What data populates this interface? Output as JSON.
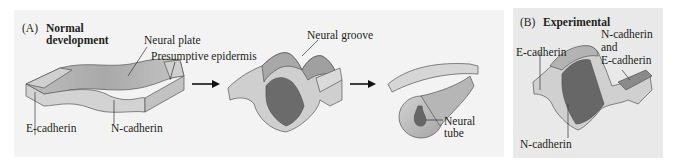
{
  "figure": {
    "panel_a": {
      "letter": "(A)",
      "title_line1": "Normal",
      "title_line2": "development",
      "labels": {
        "neural_plate": "Neural plate",
        "presumptive_epidermis": "Presumptive epidermis",
        "e_cadherin": "E-cadherin",
        "n_cadherin": "N-cadherin",
        "neural_groove": "Neural groove",
        "neural_tube_line1": "Neural",
        "neural_tube_line2": "tube"
      },
      "stages": [
        "Neural plate",
        "Neural groove",
        "Neural tube"
      ]
    },
    "panel_b": {
      "letter": "(B)",
      "title": "Experimental",
      "labels": {
        "e_cadherin": "E-cadherin",
        "n_and_e_line1": "N-cadherin",
        "n_and_e_line2": "and",
        "n_and_e_line3": "E-cadherin",
        "n_cadherin": "N-cadherin"
      }
    },
    "colors": {
      "panel_a_bg": "#f3f3f3",
      "panel_b_bg": "#e9e9e9",
      "neural_tissue": "#c9c9c9",
      "epidermis": "#dcdcdc",
      "lumen_dark": "#6e6e6e",
      "outline": "#555555"
    }
  }
}
